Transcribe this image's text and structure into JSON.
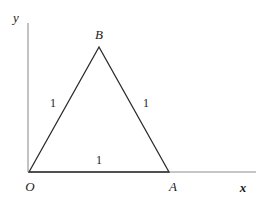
{
  "figure": {
    "type": "geometry-diagram",
    "colors": {
      "axis": "#b3b3b3",
      "triangle_stroke": "#2a2a2a",
      "text": "#1a1a1a",
      "background": "#ffffff"
    },
    "axes": {
      "x_axis": {
        "label": "x",
        "label_x": 243,
        "label_y": 187,
        "start_x": 28,
        "start_y": 172,
        "end_x": 256,
        "end_y": 172
      },
      "y_axis": {
        "label": "y",
        "label_x": 16,
        "label_y": 17,
        "start_x": 28,
        "start_y": 23,
        "end_x": 28,
        "end_y": 172
      }
    },
    "vertices": [
      {
        "name": "O",
        "label": "O",
        "x": 29,
        "y": 172,
        "label_x": 30,
        "label_y": 186
      },
      {
        "name": "A",
        "label": "A",
        "x": 169,
        "y": 172,
        "label_x": 173,
        "label_y": 186
      },
      {
        "name": "B",
        "label": "B",
        "x": 99,
        "y": 47,
        "label_x": 99,
        "label_y": 34
      }
    ],
    "sides": [
      {
        "name": "OB",
        "label": "1",
        "label_x": 53,
        "label_y": 103
      },
      {
        "name": "AB",
        "label": "1",
        "label_x": 146,
        "label_y": 103
      },
      {
        "name": "OA",
        "label": "1",
        "label_x": 99,
        "label_y": 160
      }
    ]
  }
}
